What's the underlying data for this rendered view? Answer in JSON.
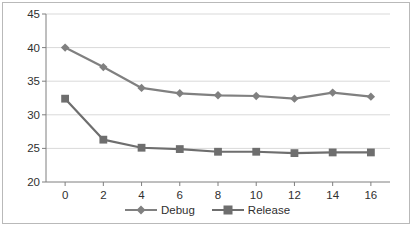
{
  "chart_data": {
    "type": "line",
    "title": "",
    "subtitle": "",
    "xlabel": "",
    "ylabel": "",
    "xlim": [
      -1,
      17
    ],
    "ylim": [
      20,
      45
    ],
    "x": [
      0,
      2,
      4,
      6,
      8,
      10,
      12,
      14,
      16
    ],
    "xtick_labels": [
      "0",
      "2",
      "4",
      "6",
      "8",
      "10",
      "12",
      "14",
      "16"
    ],
    "ytick_labels": [
      "20",
      "25",
      "30",
      "35",
      "40",
      "45"
    ],
    "ytick_values": [
      20,
      25,
      30,
      35,
      40,
      45
    ],
    "grid": "horizontal",
    "legend_position": "bottom-center",
    "series": [
      {
        "name": "Debug",
        "marker": "diamond",
        "color": "#808080",
        "values": [
          40.0,
          37.1,
          34.0,
          33.2,
          32.9,
          32.8,
          32.4,
          33.3,
          32.7
        ]
      },
      {
        "name": "Release",
        "marker": "square",
        "color": "#6e6e6e",
        "values": [
          32.4,
          26.3,
          25.1,
          24.9,
          24.5,
          24.5,
          24.3,
          24.4,
          24.4
        ]
      }
    ]
  },
  "legend": {
    "items": [
      {
        "label": "Debug",
        "marker": "diamond-marker-icon"
      },
      {
        "label": "Release",
        "marker": "square-marker-icon"
      }
    ]
  },
  "colors": {
    "series_debug": "#808080",
    "series_release": "#6e6e6e",
    "grid": "#d9d9d9",
    "axis": "#7f7f7f",
    "frame": "#b9b9b9",
    "text": "#2f2f2f",
    "background": "#ffffff"
  }
}
